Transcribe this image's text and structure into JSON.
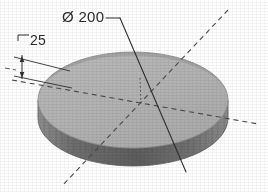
{
  "drawing": {
    "title": "Isometric disc with diameter and thickness dimensions",
    "object": "circular-disc",
    "background_color": "#ffffff"
  },
  "dimensions": [
    {
      "id": "diameter",
      "symbol": "Ø",
      "value": "200",
      "label": "Ø 200",
      "type": "diameter",
      "leader": "solid-line-through-center",
      "text_color": "#2b2b2b"
    },
    {
      "id": "thickness",
      "symbol": "",
      "value": "25",
      "label": "25",
      "type": "linear-vertical",
      "leader": "extension-lines-with-arrows",
      "text_color": "#2b2b2b"
    }
  ],
  "geometry": {
    "top_face_color": "#b3b3b3",
    "top_highlight_color": "#a3a3a3",
    "rim_color": "#6f6f6f",
    "rim_shadow_color": "#5c5c5c",
    "outline_color": "#8a8a8a",
    "centerline_color": "#4a4a4a",
    "leader_color": "#2f2f2f",
    "ellipse_center_x": "133",
    "ellipse_center_y": "100",
    "ellipse_rx": "95",
    "ellipse_ry": "48",
    "rim_height": "18"
  },
  "centerlines": [
    {
      "id": "centerline-major",
      "style": "dashed",
      "orientation": "left-right-slight-tilt"
    },
    {
      "id": "centerline-minor",
      "style": "dashed",
      "orientation": "upper-right-to-lower-left"
    },
    {
      "id": "centerline-axis",
      "style": "dotted",
      "orientation": "vertical-short"
    }
  ]
}
